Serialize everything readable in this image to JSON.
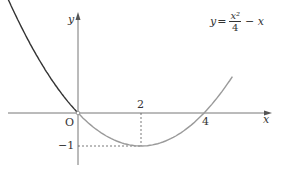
{
  "chart_data": {
    "type": "line",
    "title": "",
    "function": "y = x^2/4 - x",
    "equation_label": {
      "lhs": "y",
      "eq": "=",
      "num": "x²",
      "den": "4",
      "rest": "− x"
    },
    "xlabel": "x",
    "ylabel": "y",
    "origin_label": "O",
    "x_ticks": [
      {
        "value": 2,
        "label": "2"
      },
      {
        "value": 4,
        "label": "4"
      }
    ],
    "y_ticks": [
      {
        "value": -1,
        "label": "−1"
      }
    ],
    "vertex": {
      "x": 2,
      "y": -1
    },
    "x_intercepts": [
      0,
      4
    ],
    "series": [
      {
        "name": "x<0 branch",
        "color": "#333333",
        "x": [
          -2.4,
          -2,
          -1,
          0
        ],
        "y": [
          3.84,
          3,
          1.25,
          0
        ]
      },
      {
        "name": "x>=0 branch",
        "color": "#9a9a9a",
        "x": [
          0,
          1,
          2,
          3,
          4,
          4.9
        ],
        "y": [
          0,
          -0.75,
          -1,
          -0.75,
          0,
          1.1
        ]
      }
    ],
    "xlim": [
      -2.5,
      6
    ],
    "ylim": [
      -1.6,
      3.4
    ],
    "grid": false,
    "guides": [
      "dashed vertical x=2",
      "dashed horizontal y=-1"
    ]
  }
}
